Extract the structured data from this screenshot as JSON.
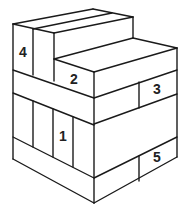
{
  "diagram": {
    "type": "isometric-block-stack",
    "line_color": "#1a1a1a",
    "background": "#ffffff",
    "labels": [
      {
        "id": "block-1",
        "text": "1",
        "x": 63,
        "y": 137
      },
      {
        "id": "block-2",
        "text": "2",
        "x": 74,
        "y": 80
      },
      {
        "id": "block-3",
        "text": "3",
        "x": 157,
        "y": 90
      },
      {
        "id": "block-4",
        "text": "4",
        "x": 23,
        "y": 53
      },
      {
        "id": "block-5",
        "text": "5",
        "x": 157,
        "y": 158
      }
    ]
  }
}
